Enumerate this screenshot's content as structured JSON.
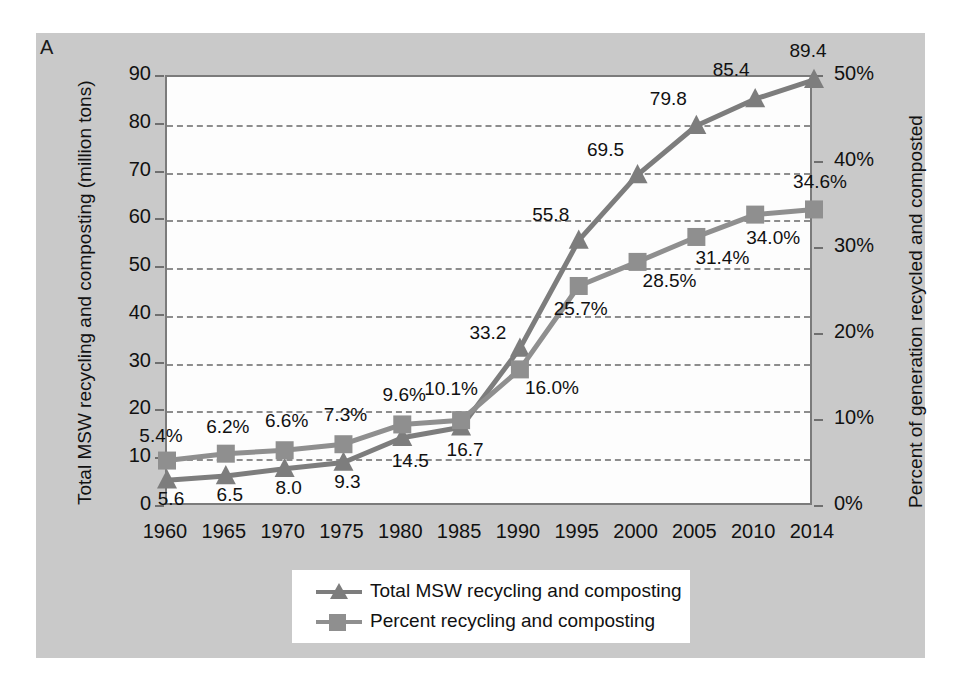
{
  "figure": {
    "panel_letter": "A",
    "background_color": "#c9c9c9",
    "plot_background": "#fdfdfd"
  },
  "chart_data": {
    "type": "line",
    "title": "",
    "xlabel": "",
    "ylabel": "Total MSW recycling and composting (million tons)",
    "y2label": "Percent of generation recycled and composted",
    "categories": [
      "1960",
      "1965",
      "1970",
      "1975",
      "1980",
      "1985",
      "1990",
      "1995",
      "2000",
      "2005",
      "2010",
      "2014"
    ],
    "ylim": [
      0,
      90
    ],
    "y2lim": [
      0,
      50
    ],
    "yticks": [
      "0",
      "10",
      "20",
      "30",
      "40",
      "50",
      "60",
      "70",
      "80",
      "90"
    ],
    "y2ticks": [
      "0%",
      "10%",
      "20%",
      "30%",
      "40%",
      "50%"
    ],
    "grid": true,
    "legend_position": "bottom-center",
    "series": [
      {
        "name": "Total MSW recycling and composting",
        "marker": "triangle",
        "color": "#7d7d7d",
        "axis": "left",
        "values": [
          5.6,
          6.5,
          8.0,
          9.3,
          14.5,
          16.7,
          33.2,
          55.8,
          69.5,
          79.8,
          85.4,
          89.4
        ],
        "labels": [
          "5.6",
          "6.5",
          "8.0",
          "9.3",
          "14.5",
          "16.7",
          "33.2",
          "55.8",
          "69.5",
          "79.8",
          "85.4",
          "89.4"
        ]
      },
      {
        "name": "Percent recycling and composting",
        "marker": "square",
        "color": "#8f8f8f",
        "axis": "right",
        "values": [
          5.4,
          6.2,
          6.6,
          7.3,
          9.6,
          10.1,
          16.0,
          25.7,
          28.5,
          31.4,
          34.0,
          34.6
        ],
        "labels": [
          "5.4%",
          "6.2%",
          "6.6%",
          "7.3%",
          "9.6%",
          "10.1%",
          "16.0%",
          "25.7%",
          "28.5%",
          "31.4%",
          "34.0%",
          "34.6%"
        ]
      }
    ]
  },
  "legend": {
    "items": [
      {
        "label": "Total MSW recycling and composting",
        "marker": "triangle",
        "color": "#7d7d7d"
      },
      {
        "label": "Percent recycling and composting",
        "marker": "square",
        "color": "#8f8f8f"
      }
    ]
  }
}
